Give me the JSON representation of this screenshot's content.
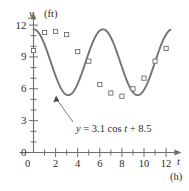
{
  "chart_data": {
    "type": "line",
    "title": "",
    "xlabel": "t",
    "xunit": "(h)",
    "ylabel": "y",
    "yunit": "(ft)",
    "xlim": [
      0,
      13.2
    ],
    "ylim": [
      0,
      13.0
    ],
    "grid": false,
    "xticks": [
      0,
      1,
      2,
      3,
      4,
      5,
      6,
      7,
      8,
      9,
      10,
      11,
      12
    ],
    "xtick_labels": [
      "0",
      "",
      "2",
      "",
      "4",
      "",
      "6",
      "",
      "8",
      "",
      "10",
      "",
      "12"
    ],
    "yticks": [
      0,
      1,
      2,
      3,
      4,
      5,
      6,
      7,
      8,
      9,
      10,
      11,
      12
    ],
    "ytick_labels": [
      "0",
      "",
      "",
      "3",
      "",
      "",
      "6",
      "",
      "",
      "9",
      "",
      "",
      "12"
    ],
    "series": [
      {
        "name": "y = 3.1 cos t + 8.5",
        "kind": "curve",
        "formula": "3.1*cos(t)+8.5",
        "amplitude": 3.1,
        "offset": 8.5,
        "x_start": 0,
        "x_end": 12.4
      },
      {
        "name": "observed data",
        "kind": "scatter",
        "marker": "open-square",
        "points": [
          [
            0.0,
            9.6
          ],
          [
            1.0,
            11.3
          ],
          [
            2.0,
            11.4
          ],
          [
            3.0,
            11.1
          ],
          [
            4.0,
            9.5
          ],
          [
            5.0,
            8.6
          ],
          [
            6.0,
            6.4
          ],
          [
            7.0,
            5.6
          ],
          [
            8.0,
            5.3
          ],
          [
            9.0,
            6.0
          ],
          [
            10.0,
            7.0
          ],
          [
            11.0,
            8.6
          ],
          [
            12.0,
            9.8
          ]
        ]
      }
    ],
    "annotations": [
      {
        "name": "equation-callout",
        "text": "y = 3.1 cos t + 8.5",
        "text_parts": {
          "lhs": "y",
          "eq": " = 3.1 cos ",
          "var": "t",
          "rhs": " + 8.5"
        },
        "points_to": [
          3.14,
          5.4
        ]
      }
    ]
  },
  "labels": {
    "y_axis_name": "y",
    "y_axis_unit": "(ft)",
    "x_axis_name": "t",
    "x_axis_unit": "(h)"
  }
}
